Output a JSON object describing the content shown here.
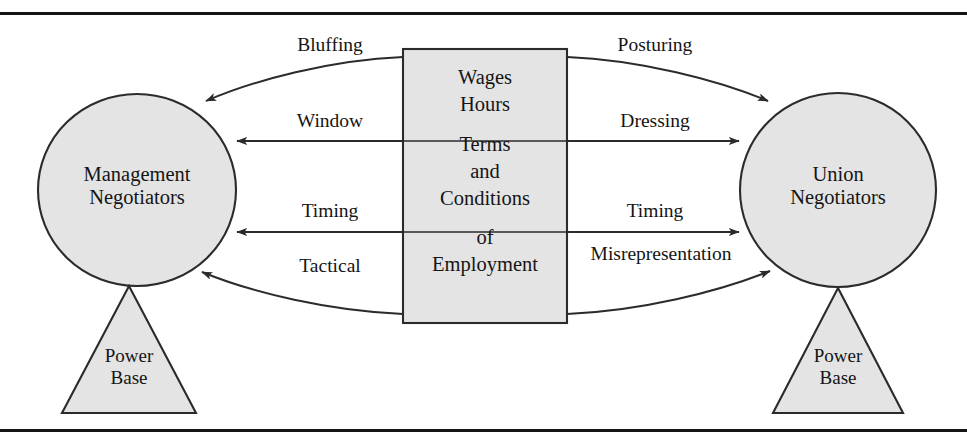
{
  "diagram": {
    "colors": {
      "shape_fill": "#e4e4e4",
      "shape_stroke": "#2b2b2b",
      "rule": "#141414",
      "text": "#151515",
      "background": "#ffffff"
    },
    "nodes": {
      "left_circle": {
        "name": "management-negotiators",
        "line1": "Management",
        "line2": "Negotiators"
      },
      "right_circle": {
        "name": "union-negotiators",
        "line1": "Union",
        "line2": "Negotiators"
      },
      "left_triangle": {
        "name": "power-base-left",
        "line1": "Power",
        "line2": "Base"
      },
      "right_triangle": {
        "name": "power-base-right",
        "line1": "Power",
        "line2": "Base"
      }
    },
    "center_box": {
      "name": "subject-matter-box",
      "lines": [
        "Wages",
        "Hours",
        "Terms",
        "and",
        "Conditions",
        "of",
        "Employment"
      ],
      "segments": 3
    },
    "arrows": {
      "left": [
        {
          "label": "Bluffing",
          "direction": "box-to-management",
          "style": "curved"
        },
        {
          "label": "Window",
          "direction": "box-to-management",
          "style": "straight"
        },
        {
          "label": "Timing",
          "direction": "box-to-management",
          "style": "straight"
        },
        {
          "label": "Tactical",
          "direction": "box-to-management",
          "style": "curved"
        }
      ],
      "right": [
        {
          "label": "Posturing",
          "direction": "box-to-union",
          "style": "curved"
        },
        {
          "label": "Dressing",
          "direction": "box-to-union",
          "style": "straight"
        },
        {
          "label": "Timing",
          "direction": "box-to-union",
          "style": "straight"
        },
        {
          "label": "Misrepresentation",
          "direction": "box-to-union",
          "style": "curved"
        }
      ]
    }
  }
}
